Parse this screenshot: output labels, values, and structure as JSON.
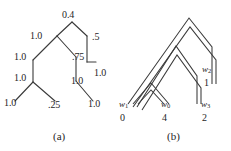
{
  "figure": {
    "background_color": "#ffffff",
    "stroke_color": "#3a3a3a",
    "text_color": "#1f1f1f",
    "panels": [
      {
        "id": "a",
        "caption": "(a)",
        "description": "binary tree with numeric edge/node labels"
      },
      {
        "id": "b",
        "caption": "(b)",
        "description": "nested double-line chevron tree with weight leaf labels"
      }
    ]
  },
  "panel_a": {
    "caption": "(a)",
    "labels": [
      {
        "id": "root",
        "text": "0.4",
        "x": 62,
        "y": 10
      },
      {
        "id": "left-1",
        "text": "1.0",
        "x": 30,
        "y": 31
      },
      {
        "id": "right-1",
        "text": ".5",
        "x": 92,
        "y": 32
      },
      {
        "id": "left-2",
        "text": "1.0",
        "x": 14,
        "y": 52
      },
      {
        "id": "mid-1",
        "text": ".75",
        "x": 72,
        "y": 52
      },
      {
        "id": "right-2",
        "text": "1.0",
        "x": 94,
        "y": 68
      },
      {
        "id": "left-3",
        "text": "1.0",
        "x": 14,
        "y": 73
      },
      {
        "id": "mid-2",
        "text": "1.0",
        "x": 71,
        "y": 76
      },
      {
        "id": "leaf-left",
        "text": "1.0",
        "x": 4,
        "y": 98
      },
      {
        "id": "leaf-mid",
        "text": ".25",
        "x": 48,
        "y": 100
      },
      {
        "id": "leaf-right",
        "text": "1.0",
        "x": 88,
        "y": 99
      }
    ]
  },
  "panel_b": {
    "caption": "(b)",
    "leaves": [
      {
        "id": "w1",
        "name": "w",
        "sub": "1",
        "value": "0",
        "x": 6,
        "y_name": 100,
        "y_val": 113
      },
      {
        "id": "w0",
        "name": "w",
        "sub": "0",
        "value": "4",
        "x": 48,
        "y_name": 100,
        "y_val": 113
      },
      {
        "id": "w3",
        "name": "w",
        "sub": "3",
        "value": "2",
        "x": 88,
        "y_name": 100,
        "y_val": 113
      }
    ],
    "inner": [
      {
        "id": "w2",
        "name": "w",
        "sub": "2",
        "value": "1",
        "x": 89,
        "y_name": 65,
        "y_val": 78
      }
    ]
  }
}
